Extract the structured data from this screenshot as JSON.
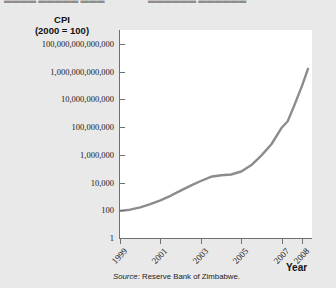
{
  "top_strip": {
    "fragment_left": "▬▬▬▬ ▬▬▬▬▬ ▬▬▬",
    "fragment_right": "▬▬▬▬▬▬ ▬▬▬▬▬▬"
  },
  "source": {
    "label": "Source:",
    "text": "Reserve Bank of Zimbabwe."
  },
  "colors": {
    "line": "#8c8c8c",
    "axis": "#6f6f6f",
    "plot_background": "#ffffff",
    "page_background": "#e9e9e9",
    "text": "#1a1a1a"
  },
  "chart_data": {
    "type": "line",
    "title": "CPI",
    "subtitle": "(2000 = 100)",
    "xlabel": "Year",
    "ylabel": "CPI (2000 = 100)",
    "yscale": "log",
    "ylim": [
      1,
      1000000000000000
    ],
    "xlim": [
      1999,
      2008.5
    ],
    "grid": false,
    "legend": null,
    "ytick_labels": [
      "100,000,000,000,000",
      "1,000,000,000,000",
      "10,000,000,000",
      "100,000,000",
      "1,000,000",
      "10,000",
      "100",
      "1"
    ],
    "ytick_values": [
      100000000000000.0,
      1000000000000.0,
      10000000000.0,
      100000000.0,
      1000000.0,
      10000.0,
      100.0,
      1
    ],
    "xtick_labels": [
      "1999",
      "2001",
      "2003",
      "2005",
      "2007",
      "2008"
    ],
    "xtick_values": [
      1999,
      2001,
      2003,
      2005,
      2007,
      2008
    ],
    "series": [
      {
        "name": "Zimbabwe CPI",
        "x": [
          1999,
          1999.5,
          2000,
          2000.5,
          2001,
          2001.5,
          2002,
          2002.5,
          2003,
          2003.5,
          2004,
          2004.5,
          2005,
          2005.5,
          2006,
          2006.5,
          2007,
          2007.3,
          2007.6,
          2008,
          2008.3
        ],
        "values": [
          90,
          110,
          160,
          280,
          520,
          1100,
          2600,
          6000,
          13000,
          26000,
          33000,
          38000,
          62000,
          180000,
          900000,
          6000000,
          90000000,
          260000000,
          3000000000,
          90000000000,
          1600000000000
        ]
      }
    ]
  },
  "axis_labels": {
    "y_title_line1": "CPI",
    "y_title_line2": "(2000 = 100)"
  }
}
